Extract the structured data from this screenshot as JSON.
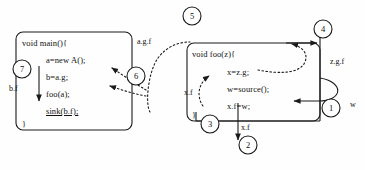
{
  "diagram": {
    "background_color": "#fefefe",
    "stroke_color": "#1a1a1a",
    "boxes": [
      {
        "id": "main-box",
        "name": "main-method-box",
        "lines": [
          {
            "text": "void main(){",
            "indent": 0,
            "underline": false
          },
          {
            "text": "a=new A();",
            "indent": 1,
            "underline": false
          },
          {
            "text": "b=a.g;",
            "indent": 1,
            "underline": false
          },
          {
            "text": "foo(a);",
            "indent": 1,
            "underline": false
          },
          {
            "text": "sink(b.f);",
            "indent": 1,
            "underline": true
          },
          {
            "text": "}",
            "indent": 0,
            "underline": false
          }
        ]
      },
      {
        "id": "foo-box",
        "name": "foo-method-box",
        "lines": [
          {
            "text": "void foo(z){",
            "indent": 0,
            "underline": false
          },
          {
            "text": "x=z.g;",
            "indent": 1,
            "underline": false
          },
          {
            "text": "w=source();",
            "indent": 1,
            "underline": false
          },
          {
            "text": "x.f=w;",
            "indent": 1,
            "underline": false
          },
          {
            "text": "}",
            "indent": 0,
            "underline": false
          }
        ]
      }
    ],
    "step_markers": [
      {
        "label": "1",
        "x": 331,
        "y": 108
      },
      {
        "label": "2",
        "x": 248,
        "y": 145
      },
      {
        "label": "3",
        "x": 210,
        "y": 124
      },
      {
        "label": "4",
        "x": 323,
        "y": 29
      },
      {
        "label": "5",
        "x": 192,
        "y": 16
      },
      {
        "label": "6",
        "x": 136,
        "y": 76
      },
      {
        "label": "7",
        "x": 22,
        "y": 69
      }
    ],
    "edge_labels": [
      {
        "text": "a.g.f",
        "x": 137,
        "y": 37
      },
      {
        "text": "b.f",
        "x": 9,
        "y": 84
      },
      {
        "text": "x.f",
        "x": 184,
        "y": 88
      },
      {
        "text": "x.f",
        "x": 241,
        "y": 123
      },
      {
        "text": "z.g.f",
        "x": 330,
        "y": 57
      },
      {
        "text": "w",
        "x": 350,
        "y": 100
      }
    ]
  }
}
